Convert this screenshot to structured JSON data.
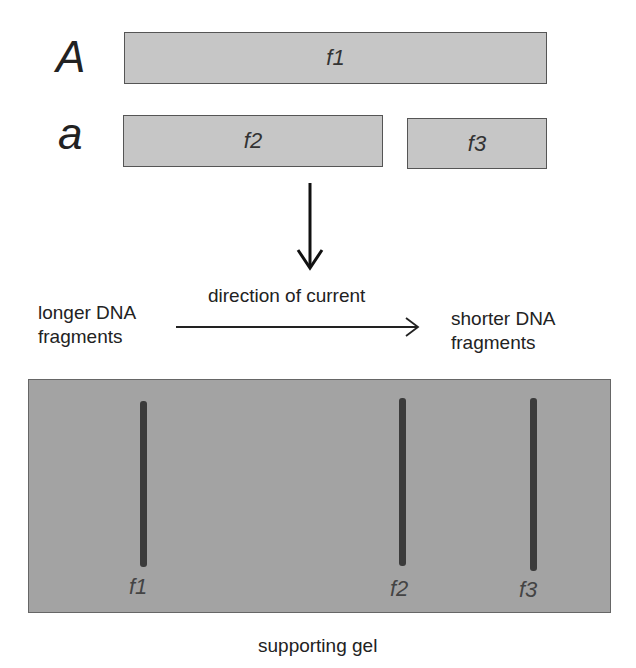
{
  "alleles": [
    {
      "label": "A",
      "fragments": [
        "f1"
      ]
    },
    {
      "label": "a",
      "fragments": [
        "f2",
        "f3"
      ]
    }
  ],
  "labels": {
    "direction": "direction of current",
    "left": [
      "longer DNA",
      "fragments"
    ],
    "right": [
      "shorter DNA",
      "fragments"
    ],
    "gel": "supporting gel"
  },
  "bands": [
    {
      "label": "f1"
    },
    {
      "label": "f2"
    },
    {
      "label": "f3"
    }
  ],
  "colors": {
    "fragment_fill": "#c6c6c6",
    "gel_fill": "#a3a3a3",
    "band": "#3b3b3b"
  }
}
